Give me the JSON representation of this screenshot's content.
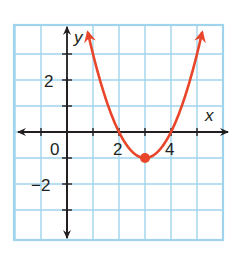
{
  "chart_data": {
    "type": "line",
    "title": "",
    "xlabel": "x",
    "ylabel": "y",
    "function": "y = (x - 3)^2 - 1",
    "x_range": [
      -2,
      6
    ],
    "y_range": [
      -4.1,
      4.1
    ],
    "grid": true,
    "x_tick_labels": [
      {
        "value": 0,
        "text": "0"
      },
      {
        "value": 2,
        "text": "2"
      },
      {
        "value": 4,
        "text": "4"
      }
    ],
    "y_tick_labels": [
      {
        "value": 2,
        "text": "2"
      },
      {
        "value": -2,
        "text": "−2"
      }
    ],
    "vertex": {
      "x": 3,
      "y": -1
    },
    "x_intercepts": [
      2,
      4
    ],
    "series": [
      {
        "name": "parabola",
        "color": "#e8452a",
        "x": [
          0.8,
          1,
          1.5,
          2,
          2.5,
          3,
          3.5,
          4,
          4.5,
          5,
          5.2
        ],
        "y": [
          3.84,
          3,
          1.25,
          0,
          -0.75,
          -1,
          -0.75,
          0,
          1.25,
          3,
          3.84
        ]
      }
    ],
    "colors": {
      "grid": "#9fd4ec",
      "axes": "#231f20",
      "curve": "#e8452a"
    }
  },
  "labels": {
    "x_axis": "x",
    "y_axis": "y",
    "origin": "0",
    "x2": "2",
    "x4": "4",
    "y2": "2",
    "yneg2": "−2"
  }
}
